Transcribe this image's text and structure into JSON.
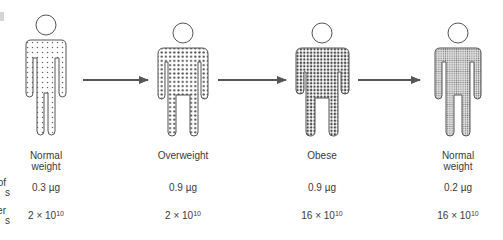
{
  "diagram": {
    "row_labels": {
      "size": {
        "visible_fragment_1": "of",
        "visible_fragment_2": "s"
      },
      "number": {
        "visible_fragment_1": "er",
        "visible_fragment_2": "s"
      }
    },
    "stages": [
      {
        "name_line1": "Normal",
        "name_line2": "weight",
        "fat_cell_size": "0.3 µg",
        "count_base": "2 ×",
        "count_exp_base": "10",
        "count_exp": "10",
        "pattern": "sparse-dots"
      },
      {
        "name_line1": "Overweight",
        "name_line2": "",
        "fat_cell_size": "0.9 µg",
        "count_base": "2 ×",
        "count_exp_base": "10",
        "count_exp": "10",
        "pattern": "medium-dots"
      },
      {
        "name_line1": "Obese",
        "name_line2": "",
        "fat_cell_size": "0.9 µg",
        "count_base": "16 ×",
        "count_exp_base": "10",
        "count_exp": "10",
        "pattern": "dense-dots"
      },
      {
        "name_line1": "Normal",
        "name_line2": "weight",
        "fat_cell_size": "0.2 µg",
        "count_base": "16 ×",
        "count_exp_base": "10",
        "count_exp": "10",
        "pattern": "fine-gray-dots"
      }
    ],
    "arrows": [
      {
        "from": "Normal weight",
        "to": "Overweight"
      },
      {
        "from": "Overweight",
        "to": "Obese"
      },
      {
        "from": "Obese",
        "to": "Normal weight"
      }
    ],
    "colors": {
      "outline": "#555555",
      "arrow": "#555555",
      "dot": "#4a4a4a",
      "text": "#3a3a3a"
    }
  }
}
